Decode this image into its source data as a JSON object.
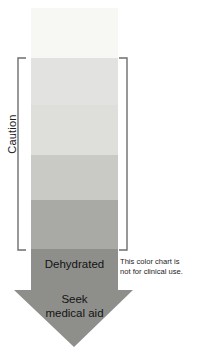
{
  "chart_data": {
    "type": "bar",
    "orientation": "vertical-gradient-column",
    "xlabel": "",
    "ylabel": "",
    "grid": false,
    "legend_position": "none",
    "categories": [
      "Hydrated",
      "Caution 1",
      "Caution 2",
      "Caution 3",
      "Caution 4",
      "Dehydrated"
    ],
    "values": [
      1,
      2,
      3,
      4,
      5,
      6
    ],
    "bands": [
      {
        "index": 1,
        "label": "Hydrated",
        "color": "#f7f7f4",
        "top": 0,
        "height": 50
      },
      {
        "index": 2,
        "label": "Caution 1",
        "color": "#e2e3e0",
        "top": 50,
        "height": 47
      },
      {
        "index": 3,
        "label": "Caution 2",
        "color": "#dedfdb",
        "top": 97,
        "height": 50
      },
      {
        "index": 4,
        "label": "Caution 3",
        "color": "#c9cac6",
        "top": 147,
        "height": 45
      },
      {
        "index": 5,
        "label": "Caution 4",
        "color": "#a9aaa6",
        "top": 192,
        "height": 49
      },
      {
        "index": 6,
        "label": "Dehydrated",
        "color": "#8f908c",
        "top": 241,
        "height": 0
      }
    ],
    "annotations": [
      {
        "name": "caution-bracket",
        "text": "Caution"
      },
      {
        "name": "dehydrated",
        "text": "Dehydrated"
      },
      {
        "name": "seek-medical-aid",
        "text": "Seek medical aid"
      },
      {
        "name": "disclaimer",
        "text": "This color chart is not for clinical use."
      }
    ]
  },
  "chart": {
    "caution_label": "Caution",
    "arrow_color": "#8e8f8b",
    "bracket_color": "#6e6e6e",
    "dehydrated_label": "Dehydrated",
    "seek_line1": "Seek",
    "seek_line2": "medical aid",
    "disclaimer_line1": "This color chart is",
    "disclaimer_line2": "not for clinical use."
  }
}
